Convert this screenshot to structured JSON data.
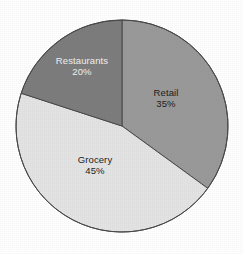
{
  "chart_data": {
    "type": "pie",
    "title": "",
    "subtitle": "",
    "xlabel": "",
    "ylabel": "",
    "legend": "none",
    "grid": false,
    "labels_on_slices": true,
    "start_angle_deg": 0,
    "direction": "clockwise",
    "categories": [
      "Retail",
      "Grocery",
      "Restaurants"
    ],
    "values": [
      35,
      45,
      20
    ],
    "units": "%",
    "slices": [
      {
        "name": "Retail",
        "label": "Retail",
        "value": 35,
        "value_label": "35%",
        "color": "#9a9a9a",
        "text_color": "#1c1c1c",
        "start_deg": 0,
        "end_deg": 126
      },
      {
        "name": "Grocery",
        "label": "Grocery",
        "value": 45,
        "value_label": "45%",
        "color": "#e4e4e4",
        "text_color": "#1c1c1c",
        "start_deg": 126,
        "end_deg": 288
      },
      {
        "name": "Restaurants",
        "label": "Restaurants",
        "value": 20,
        "value_label": "20%",
        "color": "#7d7d7d",
        "text_color": "#f2f2f2",
        "start_deg": 288,
        "end_deg": 360
      }
    ],
    "geometry": {
      "center_x": 122,
      "center_y": 126,
      "radius": 106
    },
    "style": {
      "background": "#ffffff",
      "outline_color": "#4a4a4a",
      "outline_width": 1
    }
  }
}
